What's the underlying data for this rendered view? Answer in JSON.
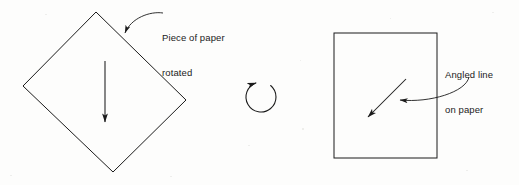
{
  "figure": {
    "background_color": "#fdfdfc",
    "ink_color": "#1b1b1b",
    "width": 519,
    "height": 185
  },
  "callouts": [
    {
      "id": "rotated",
      "line1": "Piece of paper",
      "line2": "rotated",
      "text_x": 162,
      "text_y": 9,
      "leader": {
        "start_x": 163,
        "start_y": 13,
        "ctrl1_x": 150,
        "ctrl1_y": 11,
        "ctrl2_x": 131,
        "ctrl2_y": 18,
        "end_x": 125,
        "end_y": 33,
        "arrow_angle_deg": 104
      }
    },
    {
      "id": "angled",
      "line1": "Angled line",
      "line2": "on paper",
      "text_x": 445,
      "text_y": 46,
      "leader": {
        "start_x": 469,
        "start_y": 77,
        "ctrl1_x": 466,
        "ctrl1_y": 92,
        "ctrl2_x": 430,
        "ctrl2_y": 103,
        "end_x": 400,
        "end_y": 100,
        "arrow_angle_deg": 186
      }
    }
  ],
  "shapes": {
    "rotated_square": {
      "name": "Piece of paper rotated",
      "points": "96,12 186,100 113,172 23,86",
      "stroke": "#1b1b1b",
      "stroke_width": 1
    },
    "upright_rectangle": {
      "name": "Piece of paper upright",
      "x": 334,
      "y": 33,
      "width": 103,
      "height": 125,
      "stroke": "#1b1b1b",
      "stroke_width": 1
    }
  },
  "arrows": {
    "down_arrow": {
      "name": "Downward direction arrow inside rotated paper",
      "x1": 105,
      "y1": 61,
      "x2": 105,
      "y2": 122,
      "angle_deg": 90
    },
    "angled_arrow": {
      "name": "Angled line drawn on paper",
      "x1": 406,
      "y1": 79,
      "x2": 368,
      "y2": 117,
      "angle_deg": 135
    },
    "rotation_arrow": {
      "name": "Clockwise rotation indicator",
      "center_x": 261,
      "center_y": 97,
      "radius": 15,
      "start_angle_deg": 310,
      "sweep_deg": 300,
      "arrow_angle_deg": 8
    }
  },
  "speckles": [
    {
      "x": 10,
      "y": 175,
      "w": 2,
      "h": 1
    },
    {
      "x": 45,
      "y": 14,
      "w": 2,
      "h": 1
    },
    {
      "x": 215,
      "y": 30,
      "w": 1,
      "h": 1
    },
    {
      "x": 248,
      "y": 145,
      "w": 2,
      "h": 1
    },
    {
      "x": 300,
      "y": 60,
      "w": 1,
      "h": 1
    },
    {
      "x": 302,
      "y": 128,
      "w": 2,
      "h": 2
    },
    {
      "x": 492,
      "y": 12,
      "w": 2,
      "h": 1
    },
    {
      "x": 466,
      "y": 170,
      "w": 2,
      "h": 1
    },
    {
      "x": 170,
      "y": 176,
      "w": 2,
      "h": 1
    },
    {
      "x": 390,
      "y": 18,
      "w": 1,
      "h": 1
    }
  ]
}
